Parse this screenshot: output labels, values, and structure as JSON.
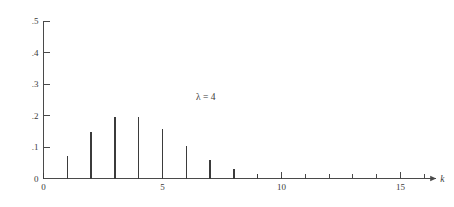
{
  "chart_data": {
    "type": "bar",
    "title": "",
    "subtitle": "",
    "xlabel": "k",
    "ylabel": "",
    "annotation": "λ = 4",
    "annotation_symbol": "λ",
    "annotation_value": "4",
    "grid": false,
    "legend": null,
    "xlim": [
      0,
      16.5
    ],
    "ylim": [
      0,
      0.5
    ],
    "x_tick_labels": [
      "0",
      "5",
      "10",
      "15"
    ],
    "x_tick_values": [
      0,
      5,
      10,
      15
    ],
    "x_minor_ticks": [
      1,
      2,
      3,
      4,
      6,
      7,
      8,
      9,
      11,
      12,
      13,
      14,
      16
    ],
    "y_tick_labels": [
      "0",
      ".1",
      ".2",
      ".3",
      ".4",
      ".5"
    ],
    "y_tick_values": [
      0,
      0.1,
      0.2,
      0.3,
      0.4,
      0.5
    ],
    "categories": [
      0,
      1,
      2,
      3,
      4,
      5,
      6,
      7,
      8,
      9,
      10,
      11,
      12,
      13,
      14,
      15,
      16
    ],
    "values": [
      0.018,
      0.073,
      0.147,
      0.195,
      0.195,
      0.156,
      0.104,
      0.06,
      0.03,
      0.013,
      0.005,
      0.002,
      0.001,
      0.0,
      0.0,
      0.0,
      0.0
    ],
    "series": [
      {
        "name": "Poisson pmf",
        "values": [
          0.018,
          0.073,
          0.147,
          0.195,
          0.195,
          0.156,
          0.104,
          0.06,
          0.03,
          0.013,
          0.005,
          0.002,
          0.001,
          0.0,
          0.0,
          0.0,
          0.0
        ]
      }
    ],
    "colors": {
      "background": "#ffffff",
      "axis": "#4a4a4a",
      "stem": "#3b3b3b",
      "text": "#3a3a3a"
    }
  },
  "axes": {
    "x_axis_name": "k",
    "y_axis_name": ""
  }
}
